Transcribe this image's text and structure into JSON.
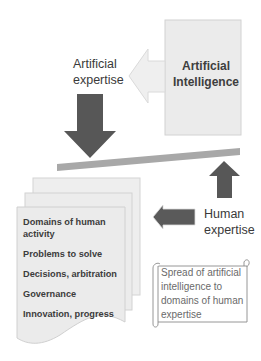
{
  "diagram": {
    "ai_box": {
      "label": "Artificial Intelligence",
      "fill": "#e9e9e9",
      "border": "#cfcfcf"
    },
    "artificial_expertise": {
      "label": "Artificial expertise"
    },
    "human_expertise": {
      "label": "Human expertise"
    },
    "documents": {
      "items": [
        {
          "label": "Domains of human activity"
        },
        {
          "label": "Problems to solve"
        },
        {
          "label": "Decisions, arbitration"
        },
        {
          "label": "Governance"
        },
        {
          "label": "Innovation, progress"
        }
      ]
    },
    "scroll": {
      "label": "Spread of artificial intelligence to domains of human expertise"
    },
    "colors": {
      "dark_arrow": "#575757",
      "light_arrow": "#eeeeee",
      "bar": "#a9a9a9",
      "doc_fill": "#ececec",
      "doc_border": "#d0d0d0",
      "text": "#3a3a3a",
      "scroll_text": "#6a6a6a"
    }
  }
}
